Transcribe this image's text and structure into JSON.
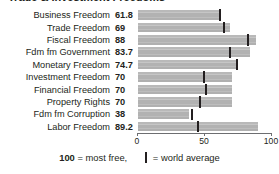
{
  "chart_title": "Trade & Investment Freedoms",
  "axis": {
    "ticks": [
      {
        "value": 0,
        "label": "0"
      },
      {
        "value": 50,
        "label": "50"
      },
      {
        "value": 100,
        "label": "100"
      }
    ],
    "min": 0,
    "max": 100
  },
  "legend": {
    "most_free_number": "100",
    "most_free_text": " = most free,",
    "world_average_text": " = world average",
    "marker_glyph": "vertical-bar-icon"
  },
  "colors": {
    "bar": "#b4b4b4",
    "marker": "#231f20",
    "text": "#231f20",
    "axis": "#6d6e71"
  },
  "chart_data": {
    "type": "bar",
    "orientation": "horizontal",
    "title": "Trade & Investment Freedoms",
    "xlabel": "",
    "ylabel": "",
    "xlim": [
      0,
      100
    ],
    "grid": false,
    "legend_position": "bottom",
    "categories": [
      "Business Freedom",
      "Trade Freedom",
      "Fiscal Freedom",
      "Fdm fm Government",
      "Monetary Freedom",
      "Investment Freedom",
      "Financial Freedom",
      "Property Rights",
      "Fdm fm Corruption",
      "Labor Freedom"
    ],
    "series": [
      {
        "name": "Country score",
        "values": [
          61.8,
          69,
          88,
          83.7,
          74.7,
          70,
          70,
          70,
          38,
          89.2
        ],
        "value_labels": [
          "61.8",
          "69",
          "88",
          "83.7",
          "74.7",
          "70",
          "70",
          "70",
          "38",
          "89.2"
        ]
      },
      {
        "name": "World average",
        "marker": "vertical-line",
        "values": [
          61,
          64,
          82,
          69,
          74,
          49,
          51,
          46,
          40,
          45
        ]
      }
    ]
  }
}
